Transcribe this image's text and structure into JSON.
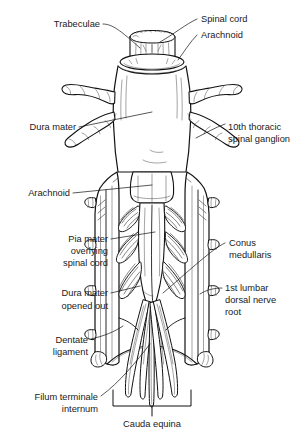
{
  "figure": {
    "background_color": "#ffffff",
    "ink_color": "#111111",
    "text_color": "#1a1a1a"
  },
  "labels": {
    "trabeculae": "Trabeculae",
    "spinal_cord": "Spinal cord",
    "arachnoid_top": "Arachnoid",
    "dura_mater": "Dura mater",
    "thoracic_ganglion_line1": "10th thoracic",
    "thoracic_ganglion_line2": "spinal ganglion",
    "arachnoid_mid": "Arachnoid",
    "pia_mater_line1": "Pia mater",
    "pia_mater_line2": "overlying",
    "pia_mater_line3": "spinal cord",
    "conus_line1": "Conus",
    "conus_line2": "medullaris",
    "dura_opened_line1": "Dura mater",
    "dura_opened_line2": "opened out",
    "lumbar_root_line1": "1st lumbar",
    "lumbar_root_line2": "dorsal nerve",
    "lumbar_root_line3": "root",
    "dentate_line1": "Dentate",
    "dentate_line2": "ligament",
    "filum_line1": "Filum terminale",
    "filum_line2": "internum",
    "cauda_equina": "Cauda equina"
  },
  "structures": {
    "spinal_cord_stump": "spinal-cord-cut-surface",
    "arachnoid_collar": "arachnoid-membrane-collar",
    "dura_tube": "dura-mater-tube",
    "nerve_root_sleeves": "spinal-nerve-root-sleeves",
    "opened_dura_flaps": "dura-mater-opened-flaps",
    "conus_medullaris": "conus-medullaris-taper",
    "cauda_equina_bundle": "cauda-equina-nerve-bundle",
    "filum_terminale": "filum-terminale-internum-strand",
    "dentate_ligament": "dentate-ligament",
    "bracket": "cauda-equina-bracket"
  }
}
